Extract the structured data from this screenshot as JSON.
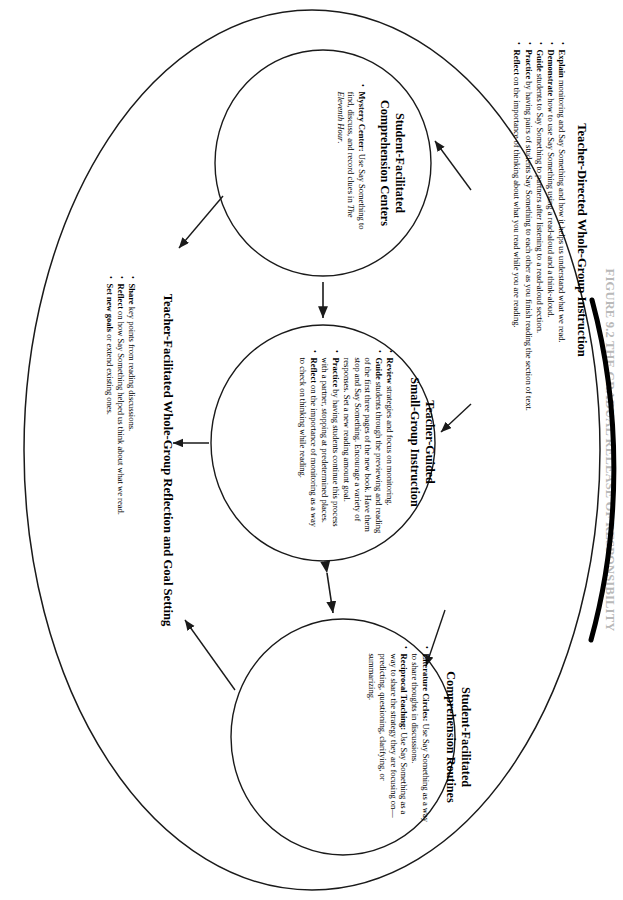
{
  "figure": {
    "masthead": "FIGURE 9.2  THE GRADUAL RELEASE OF RESPONSIBILITY",
    "top_section": {
      "title": "Teacher-Directed Whole-Group Instruction",
      "bullets": [
        {
          "lead": "Explain",
          "rest": " monitoring and Say Something and how it helps us understand what we read."
        },
        {
          "lead": "Demonstrate",
          "rest": " how to use Say Something using a read-aloud and a think-aloud."
        },
        {
          "lead": "Guide",
          "rest": " students to Say Something to partners after listening to a read-aloud section."
        },
        {
          "lead": "Practice",
          "rest": " by having pairs of students Say Something to each other as you finish reading the section of text."
        },
        {
          "lead": "Reflect",
          "rest": " on the importance of thinking about what you read while you are reading."
        }
      ]
    },
    "ovals": [
      {
        "id": "comprehension-centers",
        "title_line1": "Student-Facilitated",
        "title_line2": "Comprehension Centers",
        "bullets": [
          {
            "lead": "Mystery Center:",
            "rest": " Use Say Something to find, discuss, and record clues in ",
            "italic": "The Eleventh Hour",
            "tail": "."
          }
        ]
      },
      {
        "id": "small-group-instruction",
        "title_line1": "Teacher-Guided",
        "title_line2": "Small-Group Instruction",
        "bullets": [
          {
            "lead": "Review",
            "rest": " strategies and focus on monitoring."
          },
          {
            "lead": "Guide",
            "rest": " students through the previewing and reading of the first three pages of the new book. Have them stop and Say Something. Encourage a variety of responses. Set a new reading amount goal."
          },
          {
            "lead": "Practice",
            "rest": " by having students continue this process with a partner, stopping at predetermined places."
          },
          {
            "lead": "Reflect",
            "rest": " on the importance of monitoring as a way to check on thinking while reading."
          }
        ]
      },
      {
        "id": "comprehension-routines",
        "title_line1": "Student-Facilitated",
        "title_line2": "Comprehension Routines",
        "bullets": [
          {
            "lead": "Literature Circles:",
            "rest": " Use Say Something as a way to share thoughts in discussions."
          },
          {
            "lead": "Reciprocal Teaching:",
            "rest": " Use Say Something as a way to share the strategy they are focusing on—predicting, questioning, clarifying, or summarizing."
          }
        ]
      }
    ],
    "bottom_section": {
      "title": "Teacher-Facilitated Whole-Group Reflection and Goal Setting",
      "bullets": [
        {
          "lead": "Share",
          "rest": " key points from reading discussions."
        },
        {
          "lead": "Reflect",
          "rest": " on how Say Something helped us think about what we read."
        },
        {
          "lead": "Set new goals",
          "rest": " or extend existing ones."
        }
      ]
    },
    "colors": {
      "stroke": "#1a1a1a",
      "outer_stroke_heavy": "#000000",
      "background": "#ffffff",
      "masthead": "#b9b9b9"
    }
  }
}
